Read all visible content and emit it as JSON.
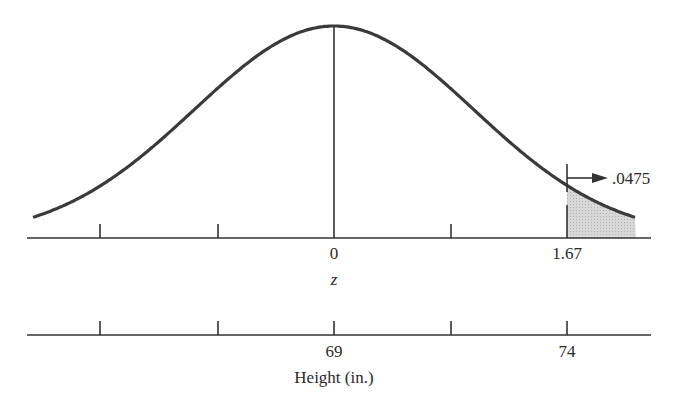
{
  "chart_data": {
    "type": "area",
    "title": "",
    "distribution": {
      "mean_height_in": 69,
      "sd_height_in": 3
    },
    "z_axis": {
      "label": "z",
      "tick_labels": [
        {
          "value": 0,
          "text": "0"
        },
        {
          "value": 1.67,
          "text": "1.67"
        }
      ],
      "tick_count": 5
    },
    "height_axis": {
      "label": "Height (in.)",
      "tick_labels": [
        {
          "value": 69,
          "text": "69"
        },
        {
          "value": 74,
          "text": "74"
        }
      ],
      "tick_count": 5
    },
    "shaded_region": {
      "from_z": 1.67,
      "to": "right tail",
      "area": 0.0475
    },
    "annotation": {
      "text": ".0475",
      "arrow": "right"
    }
  },
  "labels": {
    "z_zero": "0",
    "z_cut": "1.67",
    "z_axis": "z",
    "h_mean": "69",
    "h_cut": "74",
    "h_axis": "Height (in.)",
    "tail_area": ".0475"
  }
}
